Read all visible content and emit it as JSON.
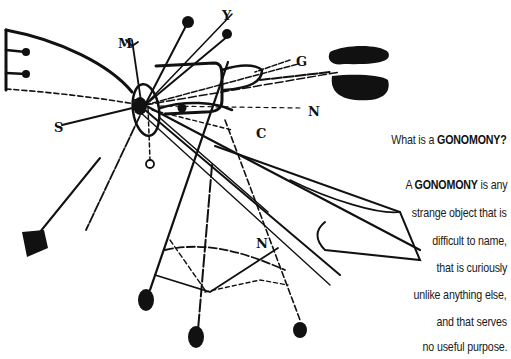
{
  "illustration": {
    "description": "Ink line drawing of an abstract contraption with lines, dots, letters and weighted ends",
    "letters": [
      "Y",
      "M",
      "G",
      "N",
      "S",
      "C",
      "O",
      "N"
    ]
  },
  "caption": {
    "question_prefix": "What is a ",
    "question_term": "GONOMONY",
    "question_suffix": "?",
    "definition_prefix": "A ",
    "definition_term": "GONOMONY",
    "definition_line1_suffix": " is any",
    "lines": [
      "strange object that is",
      "difficult to name,",
      "that is curiously",
      "unlike anything else,",
      "and that serves",
      "no useful purpose."
    ]
  },
  "colors": {
    "ink": "#111111",
    "background": "#ffffff"
  }
}
